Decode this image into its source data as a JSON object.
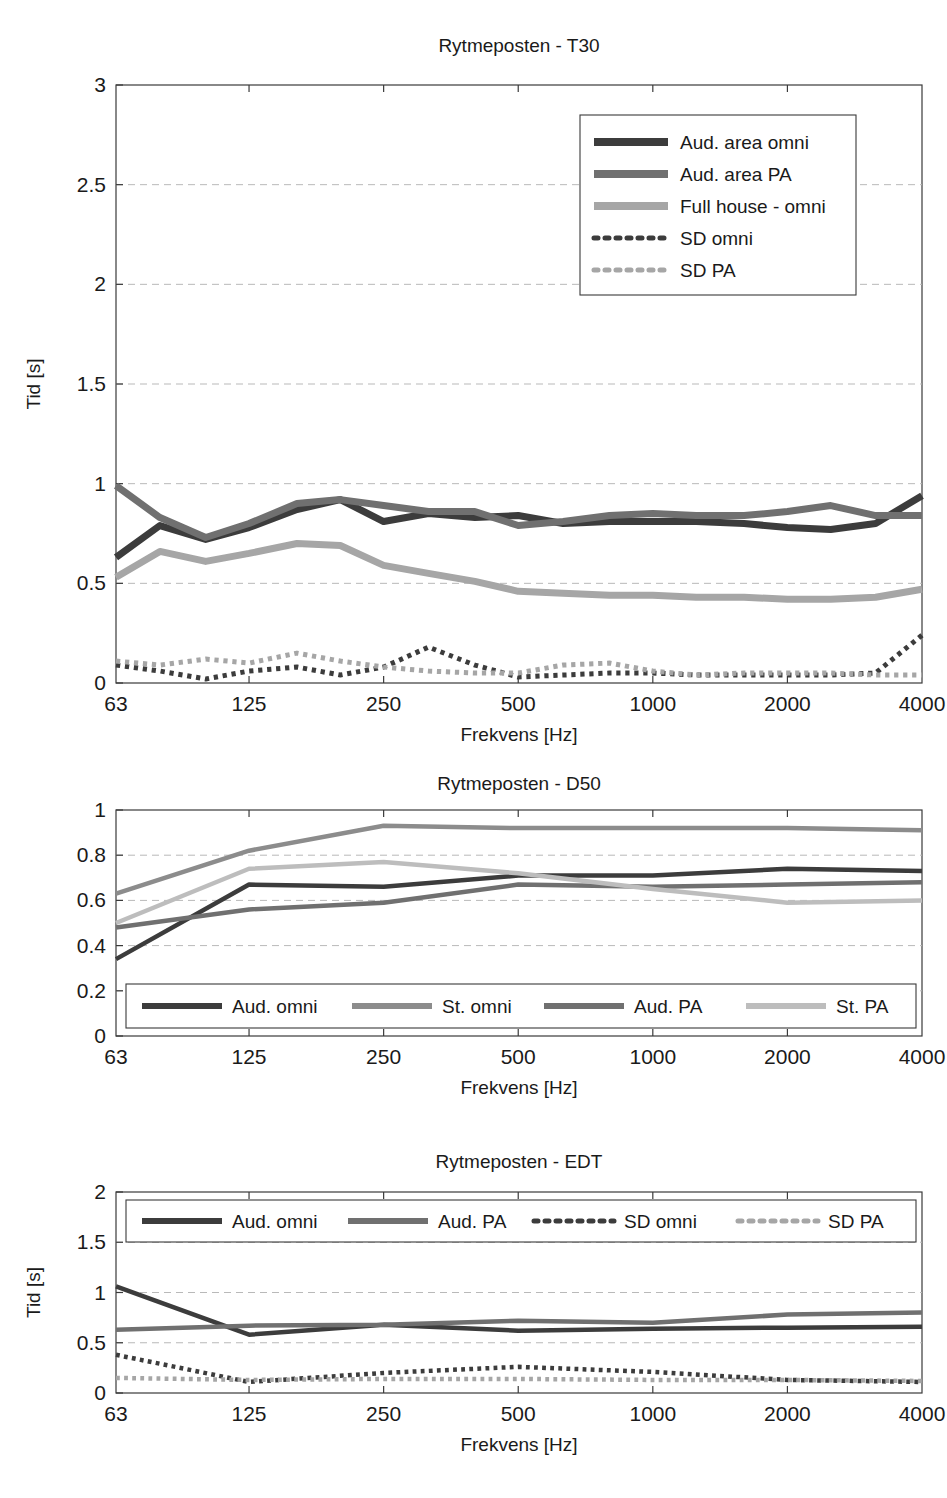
{
  "page": {
    "header_left": "",
    "header_right": ""
  },
  "colors": {
    "dark": "#3c3c3c",
    "mid_dark": "#595959",
    "mid": "#707070",
    "light": "#a6a6a6",
    "lighter": "#bdbdbd",
    "axis": "#3a3a3a",
    "grid": "#b9b9b9",
    "text": "#1a1a1a",
    "background": "#ffffff"
  },
  "charts": [
    {
      "id": "t30",
      "title": "Rytmeposten - T30",
      "xlabel": "Frekvens [Hz]",
      "ylabel": "Tid [s]",
      "type": "line",
      "xscale": "log",
      "grid": true,
      "legend_position": "top-right",
      "xticks": [
        "63",
        "125",
        "250",
        "500",
        "1000",
        "2000",
        "4000"
      ],
      "xtick_values": [
        63,
        125,
        250,
        500,
        1000,
        2000,
        4000
      ],
      "yticks": [
        "0",
        "0.5",
        "1",
        "1.5",
        "2",
        "2.5",
        "3"
      ],
      "ytick_values": [
        0,
        0.5,
        1,
        1.5,
        2,
        2.5,
        3
      ],
      "ylim": [
        0,
        3
      ],
      "xlim": [
        63,
        4000
      ],
      "x": [
        63,
        79,
        100,
        125,
        160,
        200,
        250,
        315,
        400,
        500,
        630,
        800,
        1000,
        1250,
        1600,
        2000,
        2500,
        3150,
        4000
      ],
      "series": [
        {
          "name": "Aud. area omni",
          "color": "#3c3c3c",
          "style": "solid",
          "width": 7,
          "values": [
            0.63,
            0.79,
            0.72,
            0.78,
            0.87,
            0.92,
            0.81,
            0.85,
            0.83,
            0.84,
            0.8,
            0.81,
            0.81,
            0.81,
            0.8,
            0.78,
            0.77,
            0.8,
            0.94
          ]
        },
        {
          "name": "Aud. area PA",
          "color": "#707070",
          "style": "solid",
          "width": 7,
          "values": [
            0.99,
            0.83,
            0.73,
            0.8,
            0.9,
            0.92,
            0.89,
            0.86,
            0.86,
            0.79,
            0.81,
            0.84,
            0.85,
            0.84,
            0.84,
            0.86,
            0.89,
            0.84,
            0.84
          ]
        },
        {
          "name": "Full house - omni",
          "color": "#a6a6a6",
          "style": "solid",
          "width": 7,
          "values": [
            0.53,
            0.66,
            0.61,
            0.65,
            0.7,
            0.69,
            0.59,
            0.55,
            0.51,
            0.46,
            0.45,
            0.44,
            0.44,
            0.43,
            0.43,
            0.42,
            0.42,
            0.43,
            0.47
          ]
        },
        {
          "name": "SD omni",
          "color": "#3c3c3c",
          "style": "dotted",
          "width": 5,
          "values": [
            0.09,
            0.06,
            0.02,
            0.06,
            0.08,
            0.04,
            0.08,
            0.18,
            0.09,
            0.03,
            0.04,
            0.05,
            0.05,
            0.04,
            0.04,
            0.04,
            0.04,
            0.05,
            0.24
          ]
        },
        {
          "name": "SD PA",
          "color": "#a6a6a6",
          "style": "dotted",
          "width": 5,
          "values": [
            0.11,
            0.09,
            0.12,
            0.1,
            0.15,
            0.11,
            0.08,
            0.06,
            0.05,
            0.05,
            0.09,
            0.1,
            0.06,
            0.04,
            0.05,
            0.05,
            0.05,
            0.04,
            0.04
          ]
        }
      ]
    },
    {
      "id": "d50",
      "title": "Rytmeposten - D50",
      "xlabel": "Frekvens [Hz]",
      "ylabel": "",
      "type": "line",
      "xscale": "log",
      "grid": true,
      "legend_position": "bottom-inside",
      "xticks": [
        "63",
        "125",
        "250",
        "500",
        "1000",
        "2000",
        "4000"
      ],
      "xtick_values": [
        63,
        125,
        250,
        500,
        1000,
        2000,
        4000
      ],
      "yticks": [
        "0",
        "0.2",
        "0.4",
        "0.6",
        "0.8",
        "1"
      ],
      "ytick_values": [
        0,
        0.2,
        0.4,
        0.6,
        0.8,
        1
      ],
      "ylim": [
        0,
        1
      ],
      "xlim": [
        63,
        4000
      ],
      "x": [
        63,
        125,
        250,
        500,
        1000,
        2000,
        4000
      ],
      "series": [
        {
          "name": "Aud. omni",
          "color": "#3c3c3c",
          "style": "solid",
          "width": 4.5,
          "values": [
            0.34,
            0.67,
            0.66,
            0.71,
            0.71,
            0.74,
            0.73
          ]
        },
        {
          "name": "St. omni",
          "color": "#8c8c8c",
          "style": "solid",
          "width": 4.5,
          "values": [
            0.63,
            0.82,
            0.93,
            0.92,
            0.92,
            0.92,
            0.91
          ]
        },
        {
          "name": "Aud. PA",
          "color": "#707070",
          "style": "solid",
          "width": 4.5,
          "values": [
            0.48,
            0.56,
            0.59,
            0.67,
            0.66,
            0.67,
            0.68
          ]
        },
        {
          "name": "St. PA",
          "color": "#bdbdbd",
          "style": "solid",
          "width": 4.5,
          "values": [
            0.5,
            0.74,
            0.77,
            0.72,
            0.65,
            0.59,
            0.6
          ]
        }
      ]
    },
    {
      "id": "edt",
      "title": "Rytmeposten - EDT",
      "xlabel": "Frekvens [Hz]",
      "ylabel": "Tid [s]",
      "type": "line",
      "xscale": "log",
      "grid": true,
      "legend_position": "top-inside",
      "xticks": [
        "63",
        "125",
        "250",
        "500",
        "1000",
        "2000",
        "4000"
      ],
      "xtick_values": [
        63,
        125,
        250,
        500,
        1000,
        2000,
        4000
      ],
      "yticks": [
        "0",
        "0.5",
        "1",
        "1.5",
        "2"
      ],
      "ytick_values": [
        0,
        0.5,
        1,
        1.5,
        2
      ],
      "ylim": [
        0,
        2
      ],
      "xlim": [
        63,
        4000
      ],
      "x": [
        63,
        125,
        250,
        500,
        1000,
        2000,
        4000
      ],
      "series": [
        {
          "name": "Aud. omni",
          "color": "#3c3c3c",
          "style": "solid",
          "width": 4.5,
          "values": [
            1.06,
            0.58,
            0.68,
            0.62,
            0.64,
            0.65,
            0.66
          ]
        },
        {
          "name": "Aud. PA",
          "color": "#707070",
          "style": "solid",
          "width": 4.5,
          "values": [
            0.63,
            0.67,
            0.68,
            0.72,
            0.7,
            0.78,
            0.8
          ]
        },
        {
          "name": "SD omni",
          "color": "#3c3c3c",
          "style": "dotted",
          "width": 4.5,
          "values": [
            0.38,
            0.11,
            0.2,
            0.26,
            0.21,
            0.13,
            0.11
          ]
        },
        {
          "name": "SD PA",
          "color": "#a6a6a6",
          "style": "dotted",
          "width": 4.5,
          "values": [
            0.15,
            0.13,
            0.14,
            0.14,
            0.13,
            0.13,
            0.12
          ]
        }
      ]
    }
  ]
}
